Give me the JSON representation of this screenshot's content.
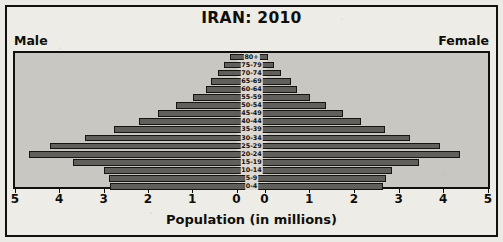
{
  "chart_data": {
    "type": "bar",
    "title": "IRAN: 2010",
    "subtype": "population-pyramid",
    "xlabel": "Population (in millions)",
    "ylabel": "",
    "left_label": "Male",
    "right_label": "Female",
    "grid": false,
    "legend_position": "none",
    "xlim": [
      5,
      0,
      5
    ],
    "x_ticks_left": [
      "5",
      "4",
      "3",
      "2",
      "1",
      "0"
    ],
    "x_ticks_right": [
      "0",
      "1",
      "2",
      "3",
      "4",
      "5"
    ],
    "axis_max": 5,
    "categories": [
      "80+",
      "75-79",
      "70-74",
      "65-69",
      "60-64",
      "55-59",
      "50-54",
      "45-49",
      "40-44",
      "35-39",
      "30-34",
      "25-29",
      "20-24",
      "15-19",
      "10-14",
      "5-9",
      "0-4"
    ],
    "series": [
      {
        "name": "Male",
        "side": "left",
        "values": [
          0.45,
          0.58,
          0.7,
          0.85,
          0.97,
          1.24,
          1.6,
          1.98,
          2.38,
          2.9,
          3.51,
          4.25,
          4.7,
          3.78,
          3.12,
          3.01,
          2.99
        ]
      },
      {
        "name": "Female",
        "side": "right",
        "values": [
          0.34,
          0.47,
          0.63,
          0.83,
          0.97,
          1.23,
          1.57,
          1.93,
          2.32,
          2.83,
          3.35,
          3.98,
          4.4,
          3.55,
          2.97,
          2.84,
          2.79
        ]
      }
    ]
  },
  "colors": {
    "bar_fill": "#615f5b",
    "bar_stroke": "#17150f",
    "plot_background": "#c9c7c2",
    "page_background": "#eeece7",
    "text": "#100e0b"
  }
}
